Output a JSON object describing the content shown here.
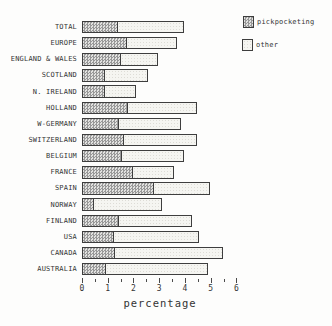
{
  "chart_data": {
    "type": "bar",
    "orientation": "horizontal",
    "stacked": true,
    "title": "",
    "xlabel": "percentage",
    "ylabel": "",
    "xlim": [
      0,
      6
    ],
    "x_major_ticks": [
      0,
      1,
      2,
      3,
      4,
      5,
      6
    ],
    "x_minor_tick_step": 0.5,
    "grid": false,
    "legend_position": "top-right",
    "categories": [
      "TOTAL",
      "EUROPE",
      "ENGLAND & WALES",
      "SCOTLAND",
      "N. IRELAND",
      "HOLLAND",
      "W-GERMANY",
      "SWITZERLAND",
      "BELGIUM",
      "FRANCE",
      "SPAIN",
      "NORWAY",
      "FINLAND",
      "USA",
      "CANADA",
      "AUSTRALIA"
    ],
    "series": [
      {
        "name": "pickpocketing",
        "pattern": "dense-gray-checker",
        "values": [
          1.4,
          1.75,
          1.5,
          0.9,
          0.9,
          1.8,
          1.45,
          1.65,
          1.55,
          2.0,
          2.8,
          0.45,
          1.45,
          1.25,
          1.3,
          0.95
        ]
      },
      {
        "name": "other",
        "pattern": "light-dots",
        "values": [
          2.6,
          2.0,
          1.5,
          1.7,
          1.25,
          2.7,
          2.45,
          2.85,
          2.45,
          1.6,
          2.2,
          2.7,
          2.85,
          3.35,
          4.2,
          4.0
        ]
      }
    ],
    "totals": [
      4.0,
      3.75,
      3.0,
      2.6,
      2.15,
      4.5,
      3.9,
      4.5,
      4.0,
      3.6,
      5.0,
      3.15,
      4.3,
      4.6,
      5.5,
      4.95
    ]
  },
  "legend": {
    "items": [
      {
        "label": "pickpocketing"
      },
      {
        "label": "other"
      }
    ]
  },
  "colors": {
    "background": "#fdfdfc",
    "bar_border": "#3e3e3e",
    "pick_dark": "#989898",
    "pick_light": "#e2e2e0",
    "other_bg": "#f5f5f1",
    "other_dot": "#dddcd6",
    "text": "#343434"
  }
}
